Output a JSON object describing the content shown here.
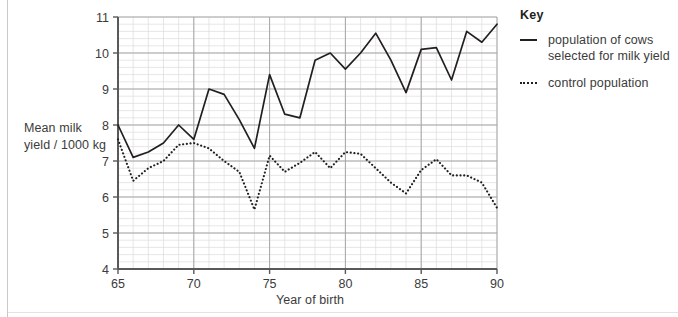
{
  "page": {
    "background_color": "#ffffff",
    "rule_color": "#c9c9c9"
  },
  "axis_titles": {
    "y": "Mean milk\nyield / 1000 kg",
    "y_line1": "Mean milk",
    "y_line2": "yield / 1000 kg",
    "x": "Year of birth"
  },
  "key": {
    "title": "Key",
    "items": [
      {
        "style": "solid",
        "label_line1": "population of cows",
        "label_line2": "selected for milk yield",
        "color": "#231f20"
      },
      {
        "style": "dotted",
        "label_line1": "control population",
        "label_line2": "",
        "color": "#231f20"
      }
    ]
  },
  "chart_data": {
    "type": "line",
    "title": "",
    "xlabel": "Year of birth",
    "ylabel": "Mean milk yield / 1000 kg",
    "xlim": [
      65,
      90
    ],
    "ylim": [
      4,
      11
    ],
    "xticks": [
      65,
      70,
      75,
      80,
      85,
      90
    ],
    "yticks": [
      4,
      5,
      6,
      7,
      8,
      9,
      10,
      11
    ],
    "grid": true,
    "grid_major_color": "#a6a6a6",
    "grid_minor_color": "#dcdcdc",
    "minor_x_step": 1,
    "minor_y_step": 0.2,
    "legend_position": "right",
    "x": [
      65,
      66,
      67,
      68,
      69,
      70,
      71,
      72,
      73,
      74,
      75,
      76,
      77,
      78,
      79,
      80,
      81,
      82,
      83,
      84,
      85,
      86,
      87,
      88,
      89,
      90
    ],
    "series": [
      {
        "name": "population of cows selected for milk yield",
        "style": "solid",
        "color": "#231f20",
        "values": [
          8.0,
          7.1,
          7.25,
          7.5,
          8.0,
          7.6,
          9.0,
          8.85,
          8.15,
          7.35,
          9.4,
          8.3,
          8.2,
          9.8,
          10.0,
          9.55,
          10.0,
          10.55,
          9.8,
          8.9,
          10.1,
          10.15,
          9.25,
          10.6,
          10.3,
          10.8
        ]
      },
      {
        "name": "control population",
        "style": "dotted",
        "color": "#231f20",
        "values": [
          7.6,
          6.45,
          6.8,
          7.0,
          7.45,
          7.5,
          7.35,
          7.0,
          6.7,
          5.65,
          7.15,
          6.7,
          6.95,
          7.25,
          6.8,
          7.25,
          7.2,
          6.8,
          6.4,
          6.1,
          6.75,
          7.05,
          6.6,
          6.6,
          6.4,
          5.7
        ]
      }
    ]
  }
}
